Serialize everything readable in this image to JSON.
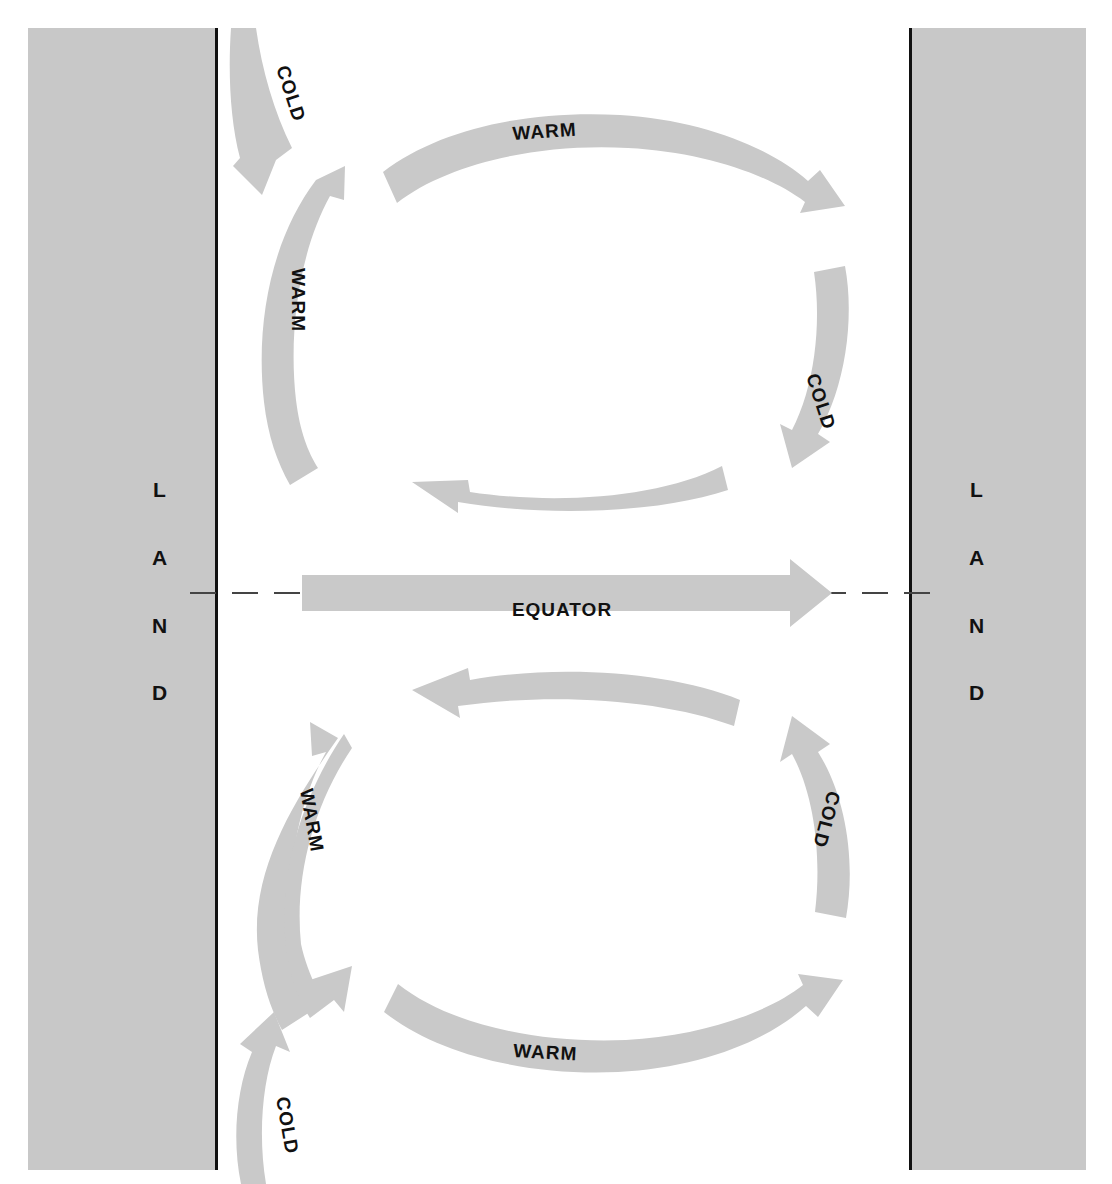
{
  "diagram": {
    "type": "ocean-circulation-gyre-diagram",
    "canvas": {
      "width": 1112,
      "height": 1184
    },
    "colors": {
      "arrow_fill": "#c9c9c9",
      "land_fill": "#c8c8c8",
      "coastline": "#111111",
      "label_text": "#111111",
      "background": "#ffffff",
      "equator_line": "#444444"
    }
  },
  "land_left": {
    "name": "LAND",
    "letters": [
      "L",
      "A",
      "N",
      "D"
    ],
    "coastline_side": "right"
  },
  "land_right": {
    "name": "LAND",
    "letters": [
      "L",
      "A",
      "N",
      "D"
    ],
    "coastline_side": "left"
  },
  "equator": {
    "label": "EQUATOR",
    "direction": "eastward",
    "line_style": "dashed"
  },
  "northern_gyre": {
    "name": "northern-hemisphere-gyre",
    "rotation": "clockwise",
    "currents": [
      {
        "id": "n-cold-inflow",
        "label": "COLD",
        "position": "top-left-outside",
        "direction": "southwest"
      },
      {
        "id": "n-warm-west",
        "label": "WARM",
        "position": "west-limb",
        "direction": "north"
      },
      {
        "id": "n-warm-north",
        "label": "WARM",
        "position": "north-limb",
        "direction": "east"
      },
      {
        "id": "n-cold-east",
        "label": "COLD",
        "position": "east-limb",
        "direction": "south"
      },
      {
        "id": "n-return-south",
        "label": "",
        "position": "south-limb",
        "direction": "west"
      }
    ]
  },
  "southern_gyre": {
    "name": "southern-hemisphere-gyre",
    "rotation": "counter-clockwise",
    "currents": [
      {
        "id": "s-return-north",
        "label": "",
        "position": "north-limb",
        "direction": "west"
      },
      {
        "id": "s-warm-west",
        "label": "WARM",
        "position": "west-limb",
        "direction": "south"
      },
      {
        "id": "s-cold-outflow",
        "label": "COLD",
        "position": "bottom-left-outside",
        "direction": "north"
      },
      {
        "id": "s-warm-south",
        "label": "WARM",
        "position": "south-limb",
        "direction": "east"
      },
      {
        "id": "s-cold-east",
        "label": "COLD",
        "position": "east-limb",
        "direction": "north"
      }
    ]
  },
  "labels": {
    "warm": "WARM",
    "cold": "COLD",
    "equator": "EQUATOR",
    "land": "LAND"
  }
}
